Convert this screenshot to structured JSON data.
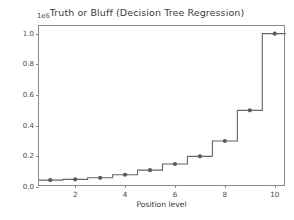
{
  "chart_data": {
    "type": "line",
    "title": "Truth or Bluff (Decision Tree Regression)",
    "xlabel": "Position level",
    "ylabel": "Salary",
    "y_offset_text": "1e6",
    "y_offset_value": 1000000,
    "grid": false,
    "legend": null,
    "xlim": [
      0.55,
      10.45
    ],
    "ylim": [
      0,
      1050000
    ],
    "xticks": [
      2,
      4,
      6,
      8,
      10
    ],
    "xtick_labels": [
      "2",
      "4",
      "6",
      "8",
      "10"
    ],
    "yticks": [
      0,
      200000,
      400000,
      600000,
      800000,
      1000000
    ],
    "ytick_labels": [
      "0.0",
      "0.2",
      "0.4",
      "0.6",
      "0.8",
      "1.0"
    ],
    "drawstyle": "steps-mid",
    "x": [
      1,
      2,
      3,
      4,
      5,
      6,
      7,
      8,
      9,
      10
    ],
    "values": [
      45000,
      50000,
      60000,
      80000,
      110000,
      150000,
      200000,
      300000,
      500000,
      1000000
    ],
    "series": [
      {
        "name": "Decision Tree prediction",
        "x": [
          1,
          2,
          3,
          4,
          5,
          6,
          7,
          8,
          9,
          10
        ],
        "values": [
          45000,
          50000,
          60000,
          80000,
          110000,
          150000,
          200000,
          300000,
          500000,
          1000000
        ],
        "line_color": "#666666",
        "marker": "circle",
        "marker_color": "#5a5a5a",
        "marker_size": 4.2,
        "line_width": 1.1
      }
    ],
    "colors": {
      "background": "#ffffff",
      "axes_face": "#ffffff",
      "spine": "#8a8a8a",
      "tick_label": "#4a4a4a",
      "title": "#3b3b3b",
      "line": "#666666",
      "marker": "#5a5a5a"
    }
  }
}
